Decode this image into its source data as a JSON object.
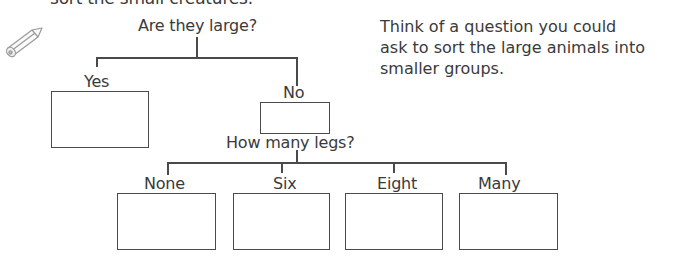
{
  "header": {
    "cropped_line": "sort the small creatures."
  },
  "tree": {
    "root_question": "Are they large?",
    "branches": [
      {
        "label": "Yes"
      },
      {
        "label": "No"
      }
    ],
    "sub_question": "How many legs?",
    "sub_branches": [
      {
        "label": "None"
      },
      {
        "label": "Six"
      },
      {
        "label": "Eight"
      },
      {
        "label": "Many"
      }
    ]
  },
  "instruction": {
    "lines": [
      "Think of a question you could",
      "ask to sort the large animals into",
      "smaller groups."
    ]
  },
  "icons": {
    "pencil": "pencil-icon"
  },
  "colors": {
    "text": "#3a3a3a",
    "lines": "#4a4a4a",
    "background": "#ffffff"
  }
}
